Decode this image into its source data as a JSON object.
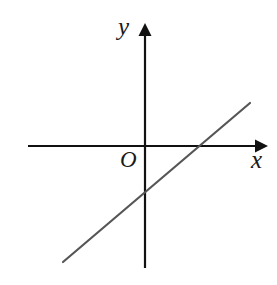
{
  "figure": {
    "background_color": "#ffffff",
    "width": 277,
    "height": 285,
    "corner_marker": {
      "text": "i",
      "color": "#b9b9b9"
    },
    "labels": {
      "y_axis": "y",
      "x_axis": "x",
      "origin": "O"
    }
  },
  "chart_data": {
    "type": "line",
    "title": "",
    "subtitle": "",
    "xlabel": "x",
    "ylabel": "y",
    "grid": false,
    "legend": null,
    "annotations": [
      {
        "text": "O",
        "role": "origin-label"
      },
      {
        "text": "y",
        "role": "y-axis-label"
      },
      {
        "text": "x",
        "role": "x-axis-label"
      },
      {
        "text": "i",
        "role": "corner-marker"
      }
    ],
    "axes": {
      "x_axis": {
        "label": "x",
        "arrow": "right",
        "pixel_y": 146,
        "pixel_x_start": 28,
        "pixel_x_end": 268,
        "color": "#111111",
        "ticks": [],
        "tick_labels": []
      },
      "y_axis": {
        "label": "y",
        "arrow": "up",
        "pixel_x": 145,
        "pixel_y_start": 268,
        "pixel_y_end": 23,
        "color": "#111111",
        "ticks": [],
        "tick_labels": []
      },
      "origin_pixel": [
        145,
        146
      ]
    },
    "series": [
      {
        "name": "line",
        "color": "#565656",
        "stroke_width": 2.2,
        "slope_sign": "positive",
        "pixel_points": [
          [
            63,
            262
          ],
          [
            250,
            103
          ]
        ],
        "x_intercept_pixel": 199,
        "y_intercept_pixel": 191,
        "description": "Straight line rising from lower-left to upper-right, crossing the y-axis below the origin and the x-axis to the right of the origin"
      }
    ]
  }
}
